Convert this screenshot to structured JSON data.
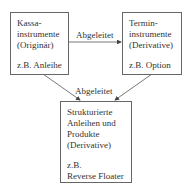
{
  "diagram": {
    "boxes": {
      "kassa": {
        "lines": [
          "Kassa-",
          "instrumente",
          "(Originär)"
        ],
        "example": "z.B. Anleihe"
      },
      "termin": {
        "lines": [
          "Termin-",
          "instrumente",
          "(Derivative)"
        ],
        "example": "z.B. Option"
      },
      "strukturiert": {
        "lines": [
          "Strukturierte",
          "Anleihen und",
          "Produkte",
          "(Derivative)"
        ],
        "example_lines": [
          "z.B.",
          "Reverse Floater"
        ]
      }
    },
    "edges": [
      {
        "from": "kassa",
        "to": "termin",
        "label": "Abgeleitet"
      },
      {
        "from": "kassa",
        "to": "strukturiert",
        "label": "Abgeleitet"
      },
      {
        "from": "termin",
        "to": "strukturiert",
        "label": "Abgeleitet"
      }
    ]
  }
}
